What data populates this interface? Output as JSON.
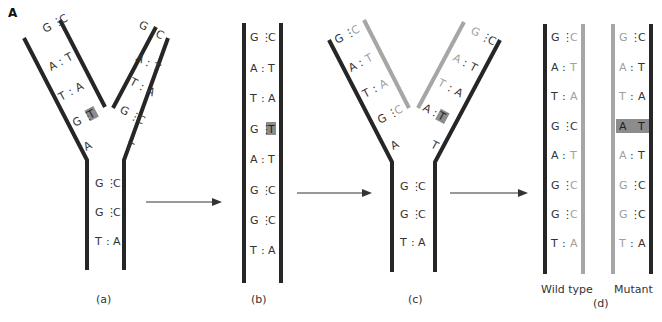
{
  "figure": {
    "label": "A",
    "colors": {
      "dark_strand": "#262626",
      "new_strand": "#a6a6a6",
      "dark_text": "#333333",
      "light_text": "#a0a0a0",
      "highlight": "#8c8c8c"
    }
  },
  "panels": {
    "a": {
      "caption": "(a)",
      "left_arm_pairs": [
        {
          "left": "G",
          "bond": "⋮",
          "right": "C"
        },
        {
          "left": "A",
          "bond": ":",
          "right": "T"
        },
        {
          "left": "T",
          "bond": ":",
          "right": "A"
        },
        {
          "left": "G",
          "bond": "⋮",
          "right": "T",
          "mismatch": true
        }
      ],
      "left_arm_unpaired": "A",
      "right_arm_pairs": [
        {
          "left": "G",
          "bond": "⋮",
          "right": "C"
        },
        {
          "left": "A",
          "bond": ":",
          "right": "T"
        },
        {
          "left": "T",
          "bond": ":",
          "right": "A"
        },
        {
          "left": "G",
          "bond": "⋮",
          "right": "C"
        }
      ],
      "right_arm_unpaired": "T",
      "stem_pairs": [
        {
          "left": "G",
          "bond": "⋮",
          "right": "C"
        },
        {
          "left": "G",
          "bond": "⋮",
          "right": "C"
        },
        {
          "left": "T",
          "bond": ":",
          "right": "A"
        }
      ]
    },
    "b": {
      "caption": "(b)",
      "pairs": [
        {
          "left": "G",
          "bond": "⋮",
          "right": "C"
        },
        {
          "left": "A",
          "bond": ":",
          "right": "T"
        },
        {
          "left": "T",
          "bond": ":",
          "right": "A"
        },
        {
          "left": "G",
          "bond": "⋮",
          "right": "T",
          "mismatch": true
        },
        {
          "left": "A",
          "bond": ":",
          "right": "T"
        },
        {
          "left": "G",
          "bond": "⋮",
          "right": "C"
        },
        {
          "left": "G",
          "bond": "⋮",
          "right": "C"
        },
        {
          "left": "T",
          "bond": ":",
          "right": "A"
        }
      ]
    },
    "c": {
      "caption": "(c)",
      "left_arm_pairs": [
        {
          "left": "G",
          "bond": "⋮",
          "right": "C"
        },
        {
          "left": "A",
          "bond": ":",
          "right": "T"
        },
        {
          "left": "T",
          "bond": ":",
          "right": "A"
        },
        {
          "left": "G",
          "bond": "⋮",
          "right": "C"
        }
      ],
      "left_arm_unpaired": "A",
      "right_arm_pairs": [
        {
          "left": "G",
          "bond": "⋮",
          "right": "C"
        },
        {
          "left": "A",
          "bond": ":",
          "right": "T"
        },
        {
          "left": "T",
          "bond": ":",
          "right": "A"
        },
        {
          "left": "A",
          "bond": ":",
          "right": "T",
          "mutation": true
        }
      ],
      "right_arm_unpaired": "T",
      "stem_pairs": [
        {
          "left": "G",
          "bond": "⋮",
          "right": "C"
        },
        {
          "left": "G",
          "bond": "⋮",
          "right": "C"
        },
        {
          "left": "T",
          "bond": ":",
          "right": "A"
        }
      ]
    },
    "d": {
      "caption": "(d)",
      "wild_type": {
        "label": "Wild type",
        "pairs": [
          {
            "left": "G",
            "bond": "⋮",
            "right": "C"
          },
          {
            "left": "A",
            "bond": ":",
            "right": "T"
          },
          {
            "left": "T",
            "bond": ":",
            "right": "A"
          },
          {
            "left": "G",
            "bond": "⋮",
            "right": "C",
            "right_dark": true
          },
          {
            "left": "A",
            "bond": ":",
            "right": "T"
          },
          {
            "left": "G",
            "bond": "⋮",
            "right": "C"
          },
          {
            "left": "G",
            "bond": "⋮",
            "right": "C"
          },
          {
            "left": "T",
            "bond": ":",
            "right": "A"
          }
        ]
      },
      "mutant": {
        "label": "Mutant",
        "pairs": [
          {
            "left": "G",
            "bond": "⋮",
            "right": "C"
          },
          {
            "left": "A",
            "bond": ":",
            "right": "T"
          },
          {
            "left": "T",
            "bond": ":",
            "right": "A"
          },
          {
            "left": "A",
            "bond": "",
            "right": "T",
            "mutation": true
          },
          {
            "left": "A",
            "bond": ":",
            "right": "T"
          },
          {
            "left": "G",
            "bond": "⋮",
            "right": "C"
          },
          {
            "left": "G",
            "bond": "⋮",
            "right": "C"
          },
          {
            "left": "T",
            "bond": ":",
            "right": "A"
          }
        ]
      }
    }
  },
  "arrows": [
    {
      "from": "a",
      "to": "b"
    },
    {
      "from": "b",
      "to": "c"
    },
    {
      "from": "c",
      "to": "d"
    }
  ]
}
